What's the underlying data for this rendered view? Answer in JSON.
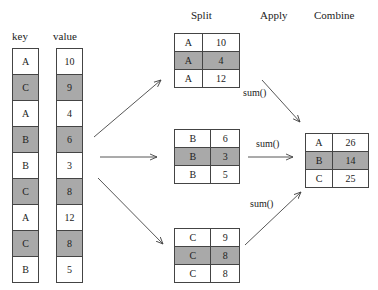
{
  "headers": {
    "key": "key",
    "value": "value",
    "split": "Split",
    "apply": "Apply",
    "combine": "Combine"
  },
  "source": {
    "keys": [
      "A",
      "C",
      "A",
      "B",
      "B",
      "C",
      "A",
      "C",
      "B"
    ],
    "values": [
      "10",
      "9",
      "4",
      "6",
      "3",
      "8",
      "12",
      "8",
      "5"
    ],
    "shaded": [
      false,
      true,
      false,
      true,
      false,
      true,
      false,
      true,
      false
    ]
  },
  "split_groups": [
    {
      "rows": [
        [
          "A",
          "10"
        ],
        [
          "A",
          "4"
        ],
        [
          "A",
          "12"
        ]
      ]
    },
    {
      "rows": [
        [
          "B",
          "6"
        ],
        [
          "B",
          "3"
        ],
        [
          "B",
          "5"
        ]
      ]
    },
    {
      "rows": [
        [
          "C",
          "9"
        ],
        [
          "C",
          "8"
        ],
        [
          "C",
          "8"
        ]
      ]
    }
  ],
  "apply_labels": [
    "sum()",
    "sum()",
    "sum()"
  ],
  "combine": {
    "rows": [
      [
        "A",
        "26"
      ],
      [
        "B",
        "14"
      ],
      [
        "C",
        "25"
      ]
    ]
  },
  "colors": {
    "shade": "#a9a9a9",
    "line": "#444444"
  }
}
